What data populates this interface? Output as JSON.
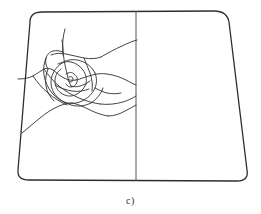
{
  "figure": {
    "caption": "c)",
    "label_name": "subfigure-label-c",
    "stroke_color": "#3a3a3a",
    "outline_color": "#2e2e2e",
    "centerline_color": "#555555",
    "background_color": "#ffffff",
    "width": 261,
    "height": 214,
    "outline": {
      "name": "rounded-trapezoid-boundary",
      "path": "M 30 22 Q 30 12 42 12 L 214 11 Q 227 11 229 22 L 247 170 Q 249 181 237 181 L 29 180 Q 17 180 18 170 Z",
      "stroke_width": 1.3
    },
    "centerline": {
      "name": "vertical-centerline",
      "x1": 136,
      "y1": 11,
      "x2": 136,
      "y2": 181,
      "stroke_width": 1.0
    },
    "scribble": {
      "name": "hand-drawn-scribble",
      "stroke_width": 0.95,
      "bbox": {
        "x": 18,
        "y": 28,
        "w": 120,
        "h": 105
      },
      "strokes": [
        "M 65 29 C 63 36 62 44 63 52 C 64 61 66 70 68 78 C 69 82 70 84 71 86",
        "M 63 52 C 60 51 56 50 53 51 C 49 52 47 55 46 58 C 45 62 46 66 48 69",
        "M 51 55 C 56 53 61 53 66 54 C 72 55 78 57 84 58 C 90 59 96 59 101 57",
        "M 101 57 C 108 53 115 49 122 46 C 128 43 133 41 137 40",
        "M 18 79 C 24 79 29 78 33 76 C 37 74 40 71 44 69 C 47 68 50 68 53 70",
        "M 53 70 C 57 73 60 76 64 78 C 68 80 72 81 76 80",
        "M 76 80 C 81 79 85 77 89 76 C 95 74 101 73 107 74 C 114 75 120 77 126 80 C 130 82 133 84 136 85",
        "M 46 58 C 44 63 43 69 44 75 C 45 82 48 88 52 93 C 56 98 61 101 67 103",
        "M 67 103 C 73 104 79 103 84 100 C 89 97 93 93 95 88 C 97 83 97 78 95 73",
        "M 95 73 C 92 67 87 63 81 61 C 75 59 69 59 64 62",
        "M 64 62 C 58 65 54 70 52 76 C 50 82 51 88 54 93",
        "M 54 93 C 58 99 64 103 71 105 C 78 107 85 106 91 103",
        "M 91 103 C 97 99 101 94 103 88",
        "M 58 64 C 62 62 67 61 71 62 C 76 63 80 66 83 70 C 86 74 87 79 86 84",
        "M 86 84 C 84 89 80 93 75 95 C 70 97 65 96 61 93",
        "M 61 93 C 57 90 55 86 55 81 C 55 76 57 72 61 69",
        "M 66 74 C 69 72 72 72 74 74 C 77 76 78 79 77 82 C 76 85 74 87 71 87 C 69 87 67 86 66 84",
        "M 69 77 C 71 76 73 77 73 79 C 73 81 72 82 70 82 C 69 82 68 81 68 80",
        "M 22 133 C 28 128 34 123 40 118 C 46 113 52 109 59 106 C 64 104 68 103 72 103",
        "M 72 103 C 78 104 84 107 90 110 C 96 113 102 115 108 116",
        "M 108 116 C 114 116 120 114 125 111 C 129 109 133 107 136 105",
        "M 44 69 C 48 75 53 81 59 86 C 65 91 72 95 79 98 C 86 101 93 103 100 104",
        "M 100 104 C 108 105 116 104 123 102 C 129 100 133 98 136 96",
        "M 33 76 C 37 82 42 88 48 93 C 54 98 60 102 67 105",
        "M 84 58 C 86 63 88 68 90 73 C 92 79 93 85 92 91",
        "M 71 86 C 74 87 77 87 80 86 C 84 85 87 83 90 81",
        "M 55 85 C 60 88 66 90 72 91 C 78 92 84 91 89 89",
        "M 48 69 C 46 74 45 80 46 86 C 47 92 50 97 54 101",
        "M 95 88 C 99 90 103 92 107 93 C 112 94 117 94 121 93",
        "M 62 40 C 63 45 63 50 63 55"
      ]
    }
  }
}
